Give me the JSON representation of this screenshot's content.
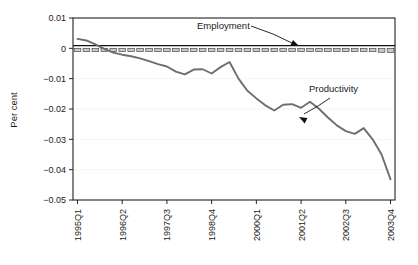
{
  "chart_data": {
    "type": "line",
    "title": "",
    "xlabel": "",
    "ylabel": "Per cent",
    "ylim": [
      -0.05,
      0.01
    ],
    "ytick_labels": [
      "0.01",
      "0",
      "−0.01",
      "−0.02",
      "−0.03",
      "−0.04",
      "−0.05"
    ],
    "ytick_values": [
      0.01,
      0,
      -0.01,
      -0.02,
      -0.03,
      -0.04,
      -0.05
    ],
    "grid": true,
    "legend": "annotations",
    "x": [
      "1995Q1",
      "1995Q2",
      "1995Q3",
      "1995Q4",
      "1996Q1",
      "1996Q2",
      "1996Q3",
      "1996Q4",
      "1997Q1",
      "1997Q2",
      "1997Q3",
      "1997Q4",
      "1998Q1",
      "1998Q2",
      "1998Q3",
      "1998Q4",
      "1999Q1",
      "1999Q2",
      "1999Q3",
      "1999Q4",
      "2000Q1",
      "2000Q2",
      "2000Q3",
      "2000Q4",
      "2001Q1",
      "2001Q2",
      "2001Q3",
      "2001Q4",
      "2002Q1",
      "2002Q2",
      "2002Q3",
      "2002Q4",
      "2003Q1",
      "2003Q2",
      "2003Q3",
      "2003Q4"
    ],
    "xtick_labels": [
      "1995Q1",
      "1996Q2",
      "1997Q3",
      "1998Q4",
      "2000Q1",
      "2001Q2",
      "2002Q3",
      "2003Q4"
    ],
    "xtick_indices": [
      0,
      5,
      10,
      15,
      20,
      25,
      30,
      35
    ],
    "series": [
      {
        "name": "Productivity",
        "type": "line",
        "color": "#6e6e6e",
        "values": [
          0.0031,
          0.0026,
          0.0013,
          -0.0002,
          -0.0014,
          -0.0021,
          -0.0026,
          -0.0033,
          -0.0042,
          -0.0052,
          -0.006,
          -0.0077,
          -0.0086,
          -0.007,
          -0.0069,
          -0.0083,
          -0.0062,
          -0.0045,
          -0.01,
          -0.014,
          -0.0165,
          -0.0188,
          -0.0205,
          -0.0186,
          -0.0184,
          -0.0196,
          -0.0176,
          -0.0199,
          -0.0228,
          -0.0254,
          -0.0273,
          -0.0282,
          -0.0263,
          -0.03,
          -0.035,
          -0.0432
        ]
      },
      {
        "name": "Employment",
        "type": "bar",
        "color": "#c9c9c9",
        "values": [
          -0.0001,
          -0.0002,
          -0.0003,
          -0.0003,
          -0.0004,
          -0.0004,
          -0.0004,
          -0.0004,
          -0.0004,
          -0.0005,
          -0.0004,
          -0.0004,
          -0.0005,
          -0.0005,
          -0.0005,
          -0.0006,
          -0.0006,
          -0.0006,
          -0.0007,
          -0.0007,
          -0.0007,
          -0.0007,
          -0.0008,
          -0.0008,
          -0.0008,
          -0.0009,
          -0.0009,
          -0.0009,
          -0.0009,
          -0.001,
          -0.001,
          -0.001,
          -0.001,
          -0.0011,
          -0.0013,
          -0.0014
        ]
      }
    ],
    "annotations": [
      {
        "text": "Employment",
        "label_x": 197,
        "label_y": 29,
        "leader": "M 251,26 L 273,34 L 294,44",
        "arrow_x": 299,
        "arrow_y": 46,
        "arrow_angle": 25
      },
      {
        "text": "Productivity",
        "label_x": 309,
        "label_y": 92,
        "leader": "M 330,98 L 318,106 L 304,114",
        "arrow_x": 299,
        "arrow_y": 117,
        "arrow_angle": 208
      }
    ]
  }
}
